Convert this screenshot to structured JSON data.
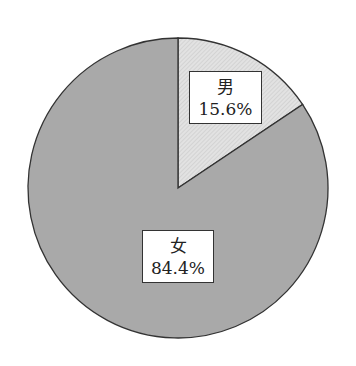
{
  "chart_data": {
    "type": "pie",
    "title": "",
    "categories": [
      "男",
      "女"
    ],
    "values": [
      15.6,
      84.4
    ],
    "unit": "%",
    "start_angle": "12 o'clock",
    "direction": "clockwise",
    "legend": "none (inline labels)",
    "slices": [
      {
        "name": "男",
        "value": 15.6,
        "label": "15.6%",
        "fill": "#dcdcdc",
        "pattern": "diagonal-hatch"
      },
      {
        "name": "女",
        "value": 84.4,
        "label": "84.4%",
        "fill": "#a9a9a9",
        "pattern": "solid"
      }
    ]
  },
  "labels": {
    "male": {
      "name": "男",
      "pct": "15.6%"
    },
    "female": {
      "name": "女",
      "pct": "84.4%"
    }
  },
  "colors": {
    "male_fill": "#dcdcdc",
    "female_fill": "#a9a9a9",
    "stroke": "#333333"
  }
}
